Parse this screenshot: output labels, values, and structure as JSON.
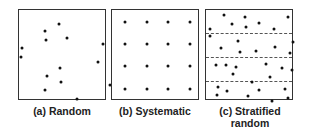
{
  "figure": {
    "panels": [
      {
        "id": "random",
        "caption_line1": "(a) Random",
        "caption_line2": "",
        "points": [
          [
            97,
            4
          ],
          [
            40,
            14
          ],
          [
            26,
            21
          ],
          [
            27,
            30
          ],
          [
            48,
            28
          ],
          [
            84,
            34
          ],
          [
            3,
            38
          ],
          [
            2,
            47
          ],
          [
            79,
            52
          ],
          [
            41,
            58
          ],
          [
            28,
            66
          ],
          [
            42,
            72
          ],
          [
            26,
            80
          ],
          [
            91,
            75
          ],
          [
            58,
            89
          ]
        ]
      },
      {
        "id": "systematic",
        "caption_line1": "(b) Systematic",
        "caption_line2": "",
        "points": [
          [
            13,
            12
          ],
          [
            35,
            12
          ],
          [
            56,
            12
          ],
          [
            78,
            12
          ],
          [
            13,
            34
          ],
          [
            35,
            34
          ],
          [
            56,
            34
          ],
          [
            78,
            34
          ],
          [
            13,
            56
          ],
          [
            35,
            56
          ],
          [
            56,
            56
          ],
          [
            78,
            56
          ],
          [
            13,
            79
          ],
          [
            35,
            79
          ],
          [
            56,
            79
          ],
          [
            78,
            79
          ]
        ]
      },
      {
        "id": "stratified-random",
        "caption_line1": "(c) Stratified",
        "caption_line2": "random",
        "strata_lines_y": [
          23,
          47,
          71
        ],
        "points": [
          [
            18,
            5
          ],
          [
            39,
            7
          ],
          [
            53,
            13
          ],
          [
            82,
            7
          ],
          [
            26,
            14
          ],
          [
            40,
            17
          ],
          [
            4,
            19
          ],
          [
            68,
            19
          ],
          [
            4,
            26
          ],
          [
            32,
            31
          ],
          [
            87,
            32
          ],
          [
            69,
            37
          ],
          [
            15,
            38
          ],
          [
            34,
            42
          ],
          [
            50,
            41
          ],
          [
            84,
            43
          ],
          [
            10,
            55
          ],
          [
            20,
            55
          ],
          [
            30,
            57
          ],
          [
            60,
            54
          ],
          [
            76,
            58
          ],
          [
            86,
            60
          ],
          [
            27,
            64
          ],
          [
            46,
            72
          ],
          [
            64,
            67
          ],
          [
            12,
            77
          ],
          [
            21,
            81
          ],
          [
            53,
            80
          ],
          [
            79,
            79
          ],
          [
            11,
            85
          ],
          [
            42,
            86
          ],
          [
            66,
            91
          ],
          [
            82,
            88
          ]
        ]
      }
    ]
  }
}
